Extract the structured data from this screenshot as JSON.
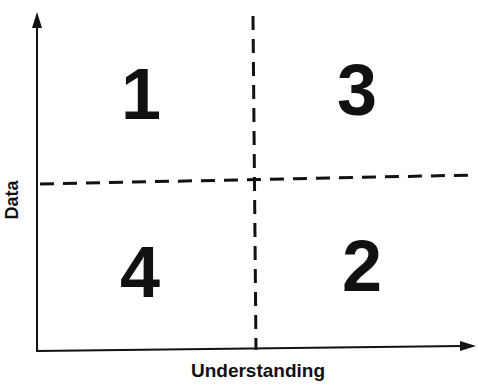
{
  "diagram": {
    "type": "quadrant",
    "x_axis_label": "Understanding",
    "y_axis_label": "Data",
    "quadrants": [
      {
        "position": "top-left",
        "label": "1"
      },
      {
        "position": "top-right",
        "label": "3"
      },
      {
        "position": "bottom-left",
        "label": "4"
      },
      {
        "position": "bottom-right",
        "label": "2"
      }
    ],
    "line_color": "#111111"
  }
}
